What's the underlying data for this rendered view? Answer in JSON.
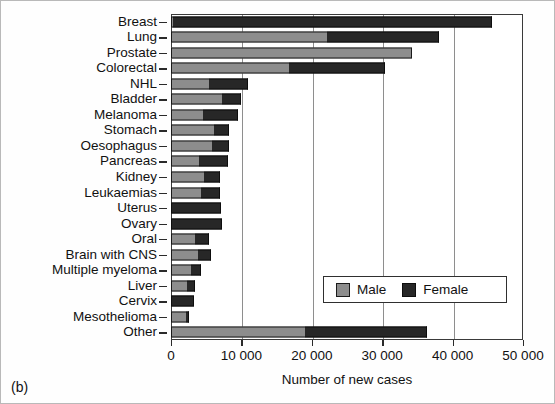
{
  "caption": "(b)",
  "chart_data": {
    "type": "bar",
    "orientation": "horizontal",
    "stacked": true,
    "title": "",
    "xlabel": "Number of new cases",
    "ylabel": "",
    "xlim": [
      0,
      50000
    ],
    "xticks": [
      0,
      10000,
      20000,
      30000,
      40000,
      50000
    ],
    "xticklabels": [
      "0",
      "10 000",
      "20 000",
      "30 000",
      "40 000",
      "50 000"
    ],
    "grid": "vertical",
    "legend_position": "lower-right",
    "categories": [
      "Breast",
      "Lung",
      "Prostate",
      "Colorectal",
      "NHL",
      "Bladder",
      "Melanoma",
      "Stomach",
      "Oesophagus",
      "Pancreas",
      "Kidney",
      "Leukaemias",
      "Uterus",
      "Ovary",
      "Oral",
      "Brain with CNS",
      "Multiple myeloma",
      "Liver",
      "Cervix",
      "Mesothelioma",
      "Other"
    ],
    "series": [
      {
        "name": "Male",
        "color": "#8d8d8d",
        "values": [
          300,
          22200,
          34200,
          16700,
          5400,
          7300,
          4500,
          6100,
          5800,
          4000,
          4700,
          4200,
          0,
          0,
          3400,
          3800,
          2800,
          2300,
          0,
          2100,
          19000
        ]
      },
      {
        "name": "Female",
        "color": "#272727",
        "values": [
          45300,
          15900,
          0,
          13700,
          5500,
          2600,
          5000,
          2100,
          2400,
          4100,
          2300,
          2700,
          7100,
          7200,
          1950,
          1900,
          1400,
          1100,
          3200,
          400,
          17300
        ]
      }
    ],
    "totals": [
      45600,
      38100,
      34200,
      30400,
      10900,
      9900,
      9500,
      8200,
      8200,
      8100,
      7000,
      6900,
      7100,
      7200,
      5350,
      5700,
      4200,
      3400,
      3200,
      2500,
      36300
    ]
  },
  "legend": {
    "items": [
      {
        "label": "Male",
        "swatch": "male-swatch"
      },
      {
        "label": "Female",
        "swatch": "female-swatch"
      }
    ]
  }
}
